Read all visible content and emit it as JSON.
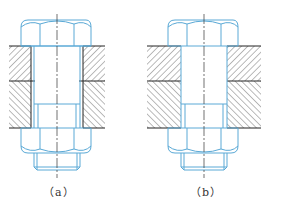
{
  "figures": [
    {
      "id": "a",
      "caption": "（a）",
      "description": "Bolt connection with clearance between bolt shank and plate holes"
    },
    {
      "id": "b",
      "caption": "（b）",
      "description": "Bolt connection with hole fitting the bolt shank (no clearance)"
    }
  ],
  "colors": {
    "part_outline": "#5aa9d6",
    "plate_edge": "#222222",
    "hatch": "#555555",
    "centerline": "#333333"
  }
}
